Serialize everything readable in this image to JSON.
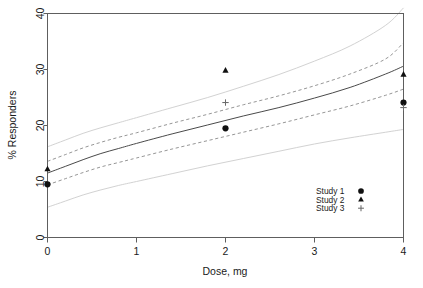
{
  "chart_data": {
    "type": "scatter",
    "title": "",
    "xlabel": "Dose, mg",
    "ylabel": "% Responders",
    "xlim": [
      0,
      4
    ],
    "ylim": [
      0,
      40
    ],
    "xticks": [
      0,
      1,
      2,
      3,
      4
    ],
    "yticks": [
      0,
      10,
      20,
      30,
      40
    ],
    "xtick_labels": [
      "0",
      "1",
      "2",
      "3",
      "4"
    ],
    "ytick_labels": [
      "0",
      "10",
      "20",
      "30",
      "40"
    ],
    "grid": false,
    "legend_position": "bottom-right",
    "legend_entries": [
      {
        "label": "Study 1",
        "marker": "circle"
      },
      {
        "label": "Study 2",
        "marker": "triangle"
      },
      {
        "label": "Study 3",
        "marker": "plus"
      }
    ],
    "series": [
      {
        "name": "Study 1",
        "marker": "circle",
        "x": [
          0,
          2,
          4
        ],
        "values": [
          9.5,
          19.5,
          24.1
        ]
      },
      {
        "name": "Study 2",
        "marker": "triangle",
        "x": [
          0,
          2,
          4
        ],
        "values": [
          12.2,
          29.8,
          29.1
        ]
      },
      {
        "name": "Study 3",
        "marker": "plus",
        "x": [
          2,
          4
        ],
        "values": [
          24.1,
          23.2
        ]
      }
    ],
    "curves": [
      {
        "name": "model-mean",
        "style": "solid",
        "x": [
          0.0,
          0.2,
          0.4,
          0.6,
          0.8,
          1.0,
          1.4,
          1.8,
          2.2,
          2.6,
          3.0,
          3.4,
          3.8,
          4.0
        ],
        "values": [
          11.5,
          12.7,
          13.9,
          15.0,
          15.9,
          16.8,
          18.5,
          20.1,
          21.7,
          23.2,
          24.9,
          26.8,
          29.2,
          30.6
        ]
      },
      {
        "name": "ci-upper-inner",
        "style": "dashed",
        "x": [
          0.0,
          0.2,
          0.4,
          0.6,
          0.8,
          1.0,
          1.4,
          1.8,
          2.2,
          2.6,
          3.0,
          3.4,
          3.8,
          4.0
        ],
        "values": [
          13.6,
          14.8,
          16.0,
          17.0,
          17.9,
          18.7,
          20.4,
          22.0,
          23.7,
          25.3,
          27.1,
          29.2,
          31.9,
          34.8
        ]
      },
      {
        "name": "ci-lower-inner",
        "style": "dashed",
        "x": [
          0.0,
          0.2,
          0.4,
          0.6,
          0.8,
          1.0,
          1.4,
          1.8,
          2.2,
          2.6,
          3.0,
          3.4,
          3.8,
          4.0
        ],
        "values": [
          9.4,
          10.5,
          11.6,
          12.6,
          13.4,
          14.2,
          15.8,
          17.3,
          18.8,
          20.3,
          21.9,
          23.5,
          25.4,
          26.5
        ]
      },
      {
        "name": "pi-upper-outer",
        "style": "solid-light",
        "x": [
          0.0,
          0.2,
          0.4,
          0.6,
          0.8,
          1.0,
          1.4,
          1.8,
          2.2,
          2.6,
          3.0,
          3.4,
          3.8,
          4.0
        ],
        "values": [
          16.2,
          17.4,
          18.6,
          19.6,
          20.5,
          21.4,
          23.2,
          25.0,
          27.0,
          29.1,
          31.5,
          34.2,
          37.9,
          41.0
        ]
      },
      {
        "name": "pi-lower-outer",
        "style": "solid-light",
        "x": [
          0.0,
          0.2,
          0.4,
          0.6,
          0.8,
          1.0,
          1.4,
          1.8,
          2.2,
          2.6,
          3.0,
          3.4,
          3.8,
          4.0
        ],
        "values": [
          5.4,
          6.5,
          7.6,
          8.5,
          9.3,
          10.0,
          11.4,
          12.8,
          14.1,
          15.4,
          16.7,
          17.8,
          18.8,
          19.3
        ]
      }
    ]
  }
}
